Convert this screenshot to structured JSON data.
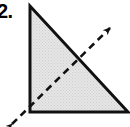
{
  "figure": {
    "label": "2.",
    "colors": {
      "stroke": "#111111",
      "fill": "#dedede",
      "fill_edge": "#c9c9c9",
      "background": "#ffffff"
    },
    "shape": {
      "type": "right-triangle",
      "vertices": [
        {
          "name": "top",
          "x": 30,
          "y": 6
        },
        {
          "name": "bottom-left",
          "x": 30,
          "y": 112
        },
        {
          "name": "bottom-right",
          "x": 128,
          "y": 112
        }
      ],
      "right_angle_at": "bottom-left",
      "fill_pattern": "halftone-gray"
    },
    "axis_line": {
      "type": "dashed-double-arrow",
      "from": {
        "x": 12,
        "y": 124
      },
      "to": {
        "x": 110,
        "y": 28
      },
      "dash_pattern": "7 5",
      "arrowhead_start": "down-left",
      "arrowhead_end": "up-right",
      "crosses_hypotenuse_at": {
        "x": 80,
        "y": 58
      }
    }
  }
}
